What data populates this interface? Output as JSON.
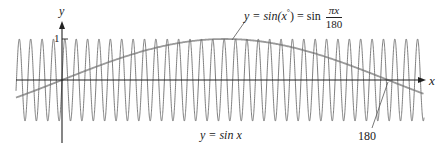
{
  "chart_data": {
    "type": "line",
    "title": "",
    "xlabel": "x",
    "ylabel": "y",
    "series": [
      {
        "name": "y = sin x",
        "function": "sin(x)",
        "color": "#6f6f6f",
        "amplitude": 1,
        "period": 6.2832
      },
      {
        "name": "y = sin(x°) = sin(πx/180)",
        "function": "sin(pi*x/180)",
        "color": "#9a9a9a",
        "amplitude": 1,
        "period": 360
      }
    ],
    "x_range": [
      -25.4,
      199.9
    ],
    "y_range": [
      -1.4,
      1.6
    ],
    "y_ticks": [
      1
    ],
    "x_annotations": [
      180
    ],
    "grid": false,
    "legend": "inline labels"
  },
  "labels": {
    "y_axis": "y",
    "x_axis": "x",
    "y_tick_one": "1",
    "sin_x": "y = sin x",
    "sin_deg_lhs": "y = sin(",
    "sin_deg_x": "x",
    "sin_deg_deg": "°",
    "sin_deg_mid": ") = sin ",
    "sin_deg_num": "πx",
    "sin_deg_den": "180",
    "x_mark_180": "180"
  },
  "colors": {
    "axis": "#222222",
    "sin_x": "#6f6f6f",
    "sin_deg": "#9a9a9a"
  }
}
